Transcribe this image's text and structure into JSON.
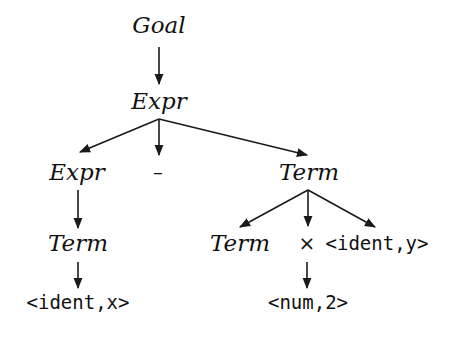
{
  "diagram": {
    "type": "parse-tree",
    "colors": {
      "line": "#1a1a1a",
      "text": "#111111",
      "background": "#ffffff"
    },
    "nodes": {
      "goal": {
        "label": "Goal",
        "kind": "nonterminal"
      },
      "expr_root": {
        "label": "Expr",
        "kind": "nonterminal"
      },
      "expr_left": {
        "label": "Expr",
        "kind": "nonterminal"
      },
      "minus": {
        "label": "–",
        "kind": "operator"
      },
      "term_right": {
        "label": "Term",
        "kind": "nonterminal"
      },
      "term_left": {
        "label": "Term",
        "kind": "nonterminal"
      },
      "term_inner": {
        "label": "Term",
        "kind": "nonterminal"
      },
      "times": {
        "label": "×",
        "kind": "operator"
      },
      "ident_y": {
        "label": "<ident,y>",
        "kind": "token"
      },
      "ident_x": {
        "label": "<ident,x>",
        "kind": "token"
      },
      "num_2": {
        "label": "<num,2>",
        "kind": "token"
      }
    },
    "edges": [
      [
        "goal",
        "expr_root"
      ],
      [
        "expr_root",
        "expr_left"
      ],
      [
        "expr_root",
        "minus"
      ],
      [
        "expr_root",
        "term_right"
      ],
      [
        "expr_left",
        "term_left"
      ],
      [
        "term_right",
        "term_inner"
      ],
      [
        "term_right",
        "times"
      ],
      [
        "term_right",
        "ident_y"
      ],
      [
        "term_left",
        "ident_x"
      ],
      [
        "times",
        "num_2"
      ]
    ]
  }
}
